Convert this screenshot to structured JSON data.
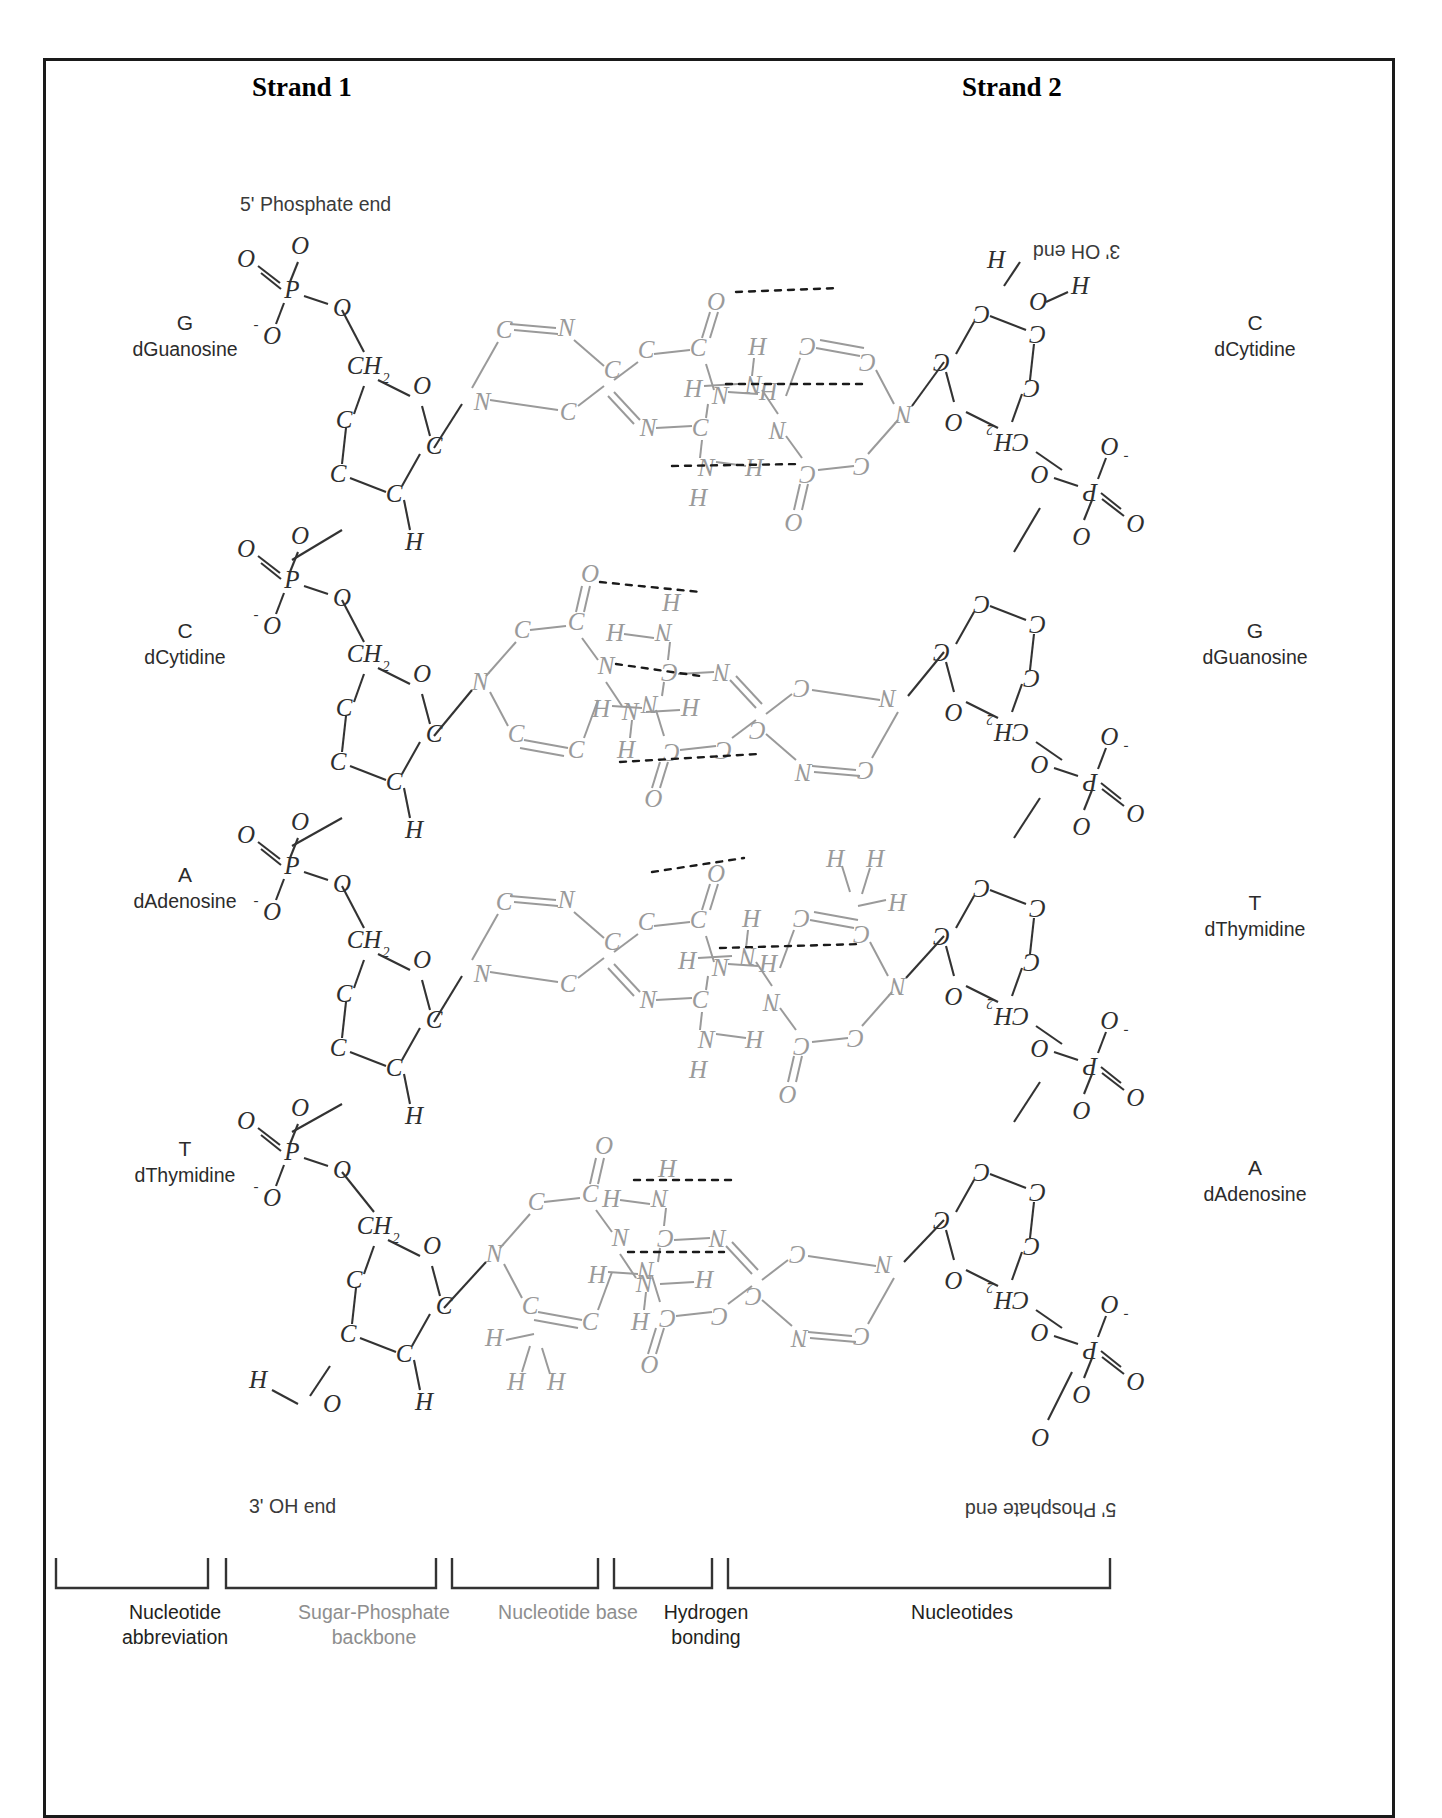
{
  "figure": {
    "type": "diagram",
    "strand1_title": "Strand 1",
    "strand2_title": "Strand 2",
    "end_labels": {
      "strand1_top": "5' Phosphate end",
      "strand1_bottom": "3' OH end",
      "strand2_top": "3' OH end",
      "strand2_bottom": "5' Phosphate end"
    }
  },
  "base_pairs": [
    {
      "row": 1,
      "left": {
        "abbr": "G",
        "name": "dGuanosine"
      },
      "right": {
        "abbr": "C",
        "name": "dCytidine"
      },
      "hydrogen_bonds": 3
    },
    {
      "row": 2,
      "left": {
        "abbr": "C",
        "name": "dCytidine"
      },
      "right": {
        "abbr": "G",
        "name": "dGuanosine"
      },
      "hydrogen_bonds": 3
    },
    {
      "row": 3,
      "left": {
        "abbr": "A",
        "name": "dAdenosine"
      },
      "right": {
        "abbr": "T",
        "name": "dThymidine"
      },
      "hydrogen_bonds": 2
    },
    {
      "row": 4,
      "left": {
        "abbr": "T",
        "name": "dThymidine"
      },
      "right": {
        "abbr": "A",
        "name": "dAdenosine"
      },
      "hydrogen_bonds": 2
    }
  ],
  "bottom_brackets": [
    {
      "label": "Nucleotide\nabbreviation",
      "line1": "Nucleotide",
      "line2": "abbreviation",
      "tone": "dark"
    },
    {
      "label": "Sugar-Phosphate\nbackbone",
      "line1": "Sugar-Phosphate",
      "line2": "backbone",
      "tone": "light"
    },
    {
      "label": "Nucleotide base",
      "line1": "Nucleotide base",
      "line2": "",
      "tone": "light"
    },
    {
      "label": "Hydrogen\nbonding",
      "line1": "Hydrogen",
      "line2": "bonding",
      "tone": "dark"
    },
    {
      "label": "Nucleotides",
      "line1": "Nucleotides",
      "line2": "",
      "tone": "dark"
    }
  ],
  "atoms": {
    "phosphorus": "P",
    "oxygen": "O",
    "oxygen_anion": "-O",
    "nitrogen": "N",
    "carbon": "C",
    "hydrogen": "H",
    "methylene": "CH",
    "methylene_sub": "2"
  },
  "colors": {
    "border": "#1a1a1a",
    "backbone_ink": "#333333",
    "base_ink": "#8e8e8e",
    "hbond": "#1a1a1a",
    "label_dark": "#231f20",
    "label_light": "#8e8e8e"
  }
}
